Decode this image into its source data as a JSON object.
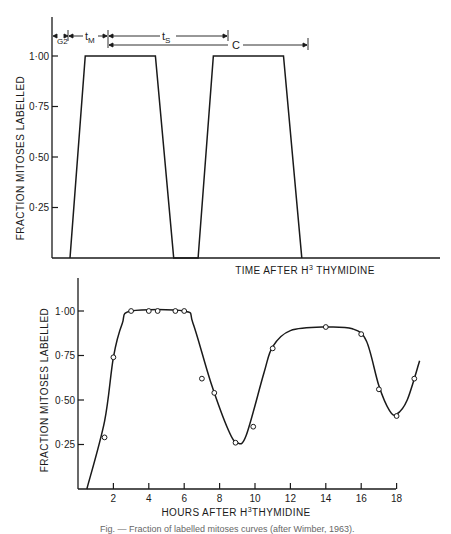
{
  "chart_data": [
    {
      "type": "line",
      "title": "Idealised fraction of labelled mitoses curve",
      "xlabel": "TIME AFTER H3 THYMIDINE",
      "xlabel_base": "TIME AFTER H",
      "xlabel_sup": "3",
      "xlabel_tail": " THYMIDINE",
      "ylabel": "FRACTION MITOSES LABELLED",
      "ylim": [
        0,
        1.1
      ],
      "yticks": [
        "1·00",
        "0·75",
        "0·50",
        "0·25"
      ],
      "x_ticks_shown": false,
      "grid": false,
      "series": [
        {
          "name": "ideal trapezoid curve",
          "points_relative": [
            [
              0.0,
              0.0
            ],
            [
              0.5,
              1.0
            ],
            [
              2.8,
              1.0
            ],
            [
              3.4,
              0.0
            ],
            [
              4.2,
              0.0
            ],
            [
              4.7,
              1.0
            ],
            [
              7.0,
              1.0
            ],
            [
              7.6,
              0.0
            ]
          ]
        }
      ],
      "annotations": [
        {
          "label": "G2",
          "label_base": "t",
          "label_sub": "G2",
          "meaning": "G2 phase duration"
        },
        {
          "label": "tM",
          "label_base": "t",
          "label_sub": "M",
          "meaning": "mitosis duration"
        },
        {
          "label": "tS",
          "label_base": "t",
          "label_sub": "S",
          "meaning": "S phase duration"
        },
        {
          "label": "C",
          "meaning": "cell cycle time"
        }
      ]
    },
    {
      "type": "line",
      "title": "Observed fraction of labelled mitoses curve",
      "xlabel": "HOURS AFTER H3 THYMIDINE",
      "xlabel_base": "HOURS AFTER H",
      "xlabel_sup": "3",
      "xlabel_tail": "THYMIDINE",
      "ylabel": "FRACTION MITOSES LABELLED",
      "xlim": [
        0,
        19.5
      ],
      "ylim": [
        0,
        1.1
      ],
      "xticks": [
        "2",
        "4",
        "6",
        "8",
        "10",
        "12",
        "14",
        "16",
        "18"
      ],
      "yticks": [
        "1·00",
        "0·75",
        "0·50",
        "0·25"
      ],
      "grid": false,
      "series": [
        {
          "name": "observed data points",
          "style": "open circles",
          "x": [
            1.5,
            2.0,
            3.0,
            4.0,
            4.5,
            5.5,
            6.0,
            7.0,
            7.7,
            8.9,
            9.9,
            11.0,
            14.0,
            16.0,
            17.0,
            18.0,
            19.0
          ],
          "y": [
            0.29,
            0.74,
            1.0,
            1.0,
            1.0,
            1.0,
            1.0,
            0.62,
            0.54,
            0.26,
            0.35,
            0.79,
            0.91,
            0.87,
            0.56,
            0.41,
            0.62
          ]
        },
        {
          "name": "fitted curve",
          "style": "solid line",
          "x": [
            0.5,
            1.5,
            2.0,
            2.5,
            3.0,
            6.0,
            6.5,
            7.5,
            8.5,
            9.0,
            9.5,
            10.5,
            11.0,
            12.0,
            14.0,
            15.5,
            16.3,
            17.0,
            17.6,
            18.0,
            18.6,
            19.3
          ],
          "y": [
            0.0,
            0.38,
            0.74,
            0.93,
            1.0,
            1.0,
            0.93,
            0.6,
            0.33,
            0.26,
            0.3,
            0.65,
            0.8,
            0.89,
            0.91,
            0.9,
            0.83,
            0.58,
            0.44,
            0.42,
            0.5,
            0.72
          ]
        }
      ]
    }
  ],
  "caption": "Fig. — Fraction of labelled mitoses curves (after Wimber, 1963)."
}
